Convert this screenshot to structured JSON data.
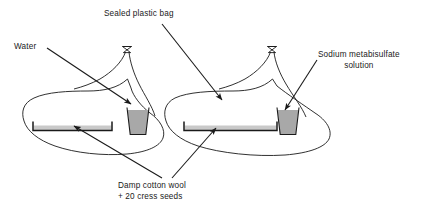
{
  "diagram": {
    "background_color": "#ffffff",
    "line_color": "#1a1a1a",
    "text_color": "#1a1a1a",
    "beaker_fill_color": "#a8a8a8",
    "cotton_wool_fill_color": "#c9c9c9"
  },
  "labels": {
    "water": "Water",
    "sealed_bag": "Sealed plastic bag",
    "sodium_line1": "Sodium metabisulfate",
    "sodium_line2": "solution",
    "cotton_line1": "Damp cotton wool",
    "cotton_line2": "+ 20 cress seeds"
  },
  "apparatus": {
    "bags": [
      {
        "name": "left-sealed-bag",
        "contains_beaker_liquid": "Water",
        "contains_tray": "Damp cotton wool + 20 cress seeds"
      },
      {
        "name": "right-sealed-bag",
        "contains_beaker_liquid": "Sodium metabisulfate solution",
        "contains_tray": "Damp cotton wool + 20 cress seeds"
      }
    ],
    "seed_count": "20"
  }
}
